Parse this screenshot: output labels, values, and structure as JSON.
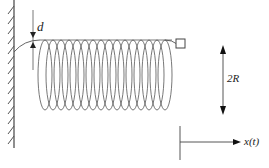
{
  "diagram": {
    "type": "helical spring attached to wall, with mass at end",
    "labels": {
      "gap": "d",
      "diameter": "2R",
      "displacement": "x(t)"
    },
    "coil": {
      "turns": 16
    },
    "colors": {
      "stroke": "#444444",
      "background": "#ffffff"
    }
  }
}
